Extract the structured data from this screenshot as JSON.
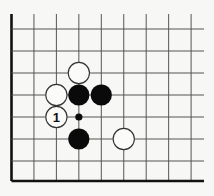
{
  "diagram": {
    "type": "go-board-corner",
    "board": {
      "columns": 9,
      "rows": 8,
      "edges": [
        "left",
        "bottom"
      ]
    },
    "stones": [
      {
        "color": "white",
        "col": 3,
        "row": 2,
        "label": ""
      },
      {
        "color": "black",
        "col": 3,
        "row": 3,
        "label": ""
      },
      {
        "color": "black",
        "col": 4,
        "row": 3,
        "label": ""
      },
      {
        "color": "white",
        "col": 2,
        "row": 3,
        "label": ""
      },
      {
        "color": "white",
        "col": 2,
        "row": 4,
        "label": "1"
      },
      {
        "color": "black",
        "col": 3,
        "row": 5,
        "label": ""
      },
      {
        "color": "white",
        "col": 5,
        "row": 5,
        "label": ""
      }
    ],
    "markers": [
      {
        "type": "dot",
        "col": 3,
        "row": 4
      }
    ]
  }
}
